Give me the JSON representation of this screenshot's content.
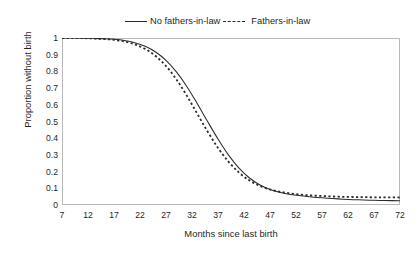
{
  "chart_data": {
    "type": "line",
    "title": "",
    "xlabel": "Months since last birth",
    "ylabel": "Proportion without birth",
    "xlim": [
      7,
      72
    ],
    "ylim": [
      0,
      1
    ],
    "grid": false,
    "legend_position": "top-center",
    "x_ticks": [
      7,
      12,
      17,
      22,
      27,
      32,
      37,
      42,
      47,
      52,
      57,
      62,
      67,
      72
    ],
    "y_ticks": [
      "0",
      "0.1",
      "0.2",
      "0.3",
      "0.4",
      "0.5",
      "0.6",
      "0.7",
      "0.8",
      "0.9",
      "1"
    ],
    "line_color": "#2b2b2b",
    "x": [
      7,
      9,
      11,
      13,
      15,
      17,
      19,
      21,
      23,
      25,
      27,
      29,
      31,
      33,
      35,
      37,
      39,
      41,
      43,
      45,
      47,
      49,
      51,
      53,
      55,
      57,
      59,
      61,
      63,
      65,
      67,
      69,
      72
    ],
    "series": [
      {
        "name": "No fathers-in-law",
        "style": "solid",
        "values": [
          1.0,
          1.0,
          0.999,
          0.998,
          0.996,
          0.992,
          0.985,
          0.972,
          0.95,
          0.916,
          0.866,
          0.797,
          0.71,
          0.608,
          0.5,
          0.395,
          0.3,
          0.222,
          0.163,
          0.121,
          0.093,
          0.075,
          0.063,
          0.055,
          0.048,
          0.043,
          0.039,
          0.035,
          0.032,
          0.03,
          0.028,
          0.027,
          0.025
        ]
      },
      {
        "name": "Fathers-in-law",
        "style": "dashed",
        "values": [
          1.0,
          1.0,
          0.999,
          0.997,
          0.994,
          0.989,
          0.979,
          0.962,
          0.934,
          0.892,
          0.832,
          0.752,
          0.655,
          0.547,
          0.44,
          0.342,
          0.26,
          0.195,
          0.148,
          0.115,
          0.093,
          0.079,
          0.069,
          0.062,
          0.057,
          0.054,
          0.051,
          0.049,
          0.048,
          0.047,
          0.046,
          0.046,
          0.045
        ]
      }
    ]
  },
  "legend": {
    "series_one_label": "No fathers-in-law",
    "series_two_label": "Fathers-in-law"
  },
  "axes": {
    "y_title": "Proportion without birth",
    "x_title": "Months since last birth"
  }
}
